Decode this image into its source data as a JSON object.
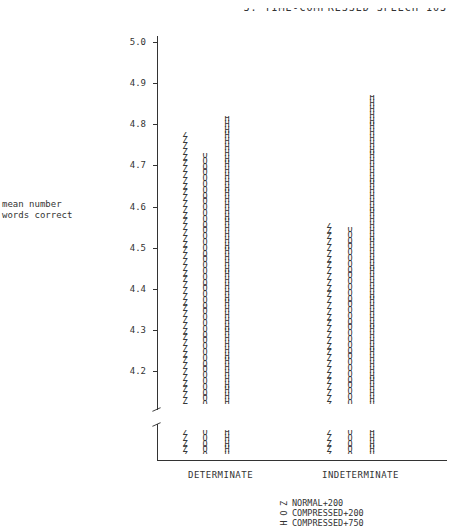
{
  "header": {
    "text": "3.  TIME-COMPRESSED SPEECH   103"
  },
  "chart_data": {
    "type": "bar",
    "title": "",
    "xlabel": "",
    "ylabel": "mean number words correct",
    "ylim": [
      4.1,
      5.0
    ],
    "y_ticks": [
      "5.0",
      "4.9",
      "4.8",
      "4.7",
      "4.6",
      "4.5",
      "4.4",
      "4.3",
      "4.2"
    ],
    "axis_break": true,
    "categories": [
      "DETERMINATE",
      "INDETERMINATE"
    ],
    "series": [
      {
        "name": "NORMAL+200",
        "glyph": "Z",
        "values": [
          4.78,
          4.56
        ]
      },
      {
        "name": "COMPRESSED+200",
        "glyph": "O",
        "values": [
          4.73,
          4.55
        ]
      },
      {
        "name": "COMPRESSED+750",
        "glyph": "H",
        "values": [
          4.82,
          4.87
        ]
      }
    ],
    "legend_position": "bottom",
    "grid": false
  },
  "axis": {
    "ylabel_line1": "mean number",
    "ylabel_line2": "words correct",
    "ticks": [
      {
        "label": "5.0",
        "y": 42
      },
      {
        "label": "4.9",
        "y": 83
      },
      {
        "label": "4.8",
        "y": 124
      },
      {
        "label": "4.7",
        "y": 165
      },
      {
        "label": "4.6",
        "y": 207
      },
      {
        "label": "4.5",
        "y": 248
      },
      {
        "label": "4.4",
        "y": 289
      },
      {
        "label": "4.3",
        "y": 330
      },
      {
        "label": "4.2",
        "y": 371
      }
    ]
  },
  "categories": {
    "det": "DETERMINATE",
    "indet": "INDETERMINATE"
  },
  "legend": {
    "items": [
      {
        "glyph": "Z",
        "label": "NORMAL+200"
      },
      {
        "glyph": "O",
        "label": "COMPRESSED+200"
      },
      {
        "glyph": "H",
        "label": "COMPRESSED+750"
      }
    ]
  }
}
